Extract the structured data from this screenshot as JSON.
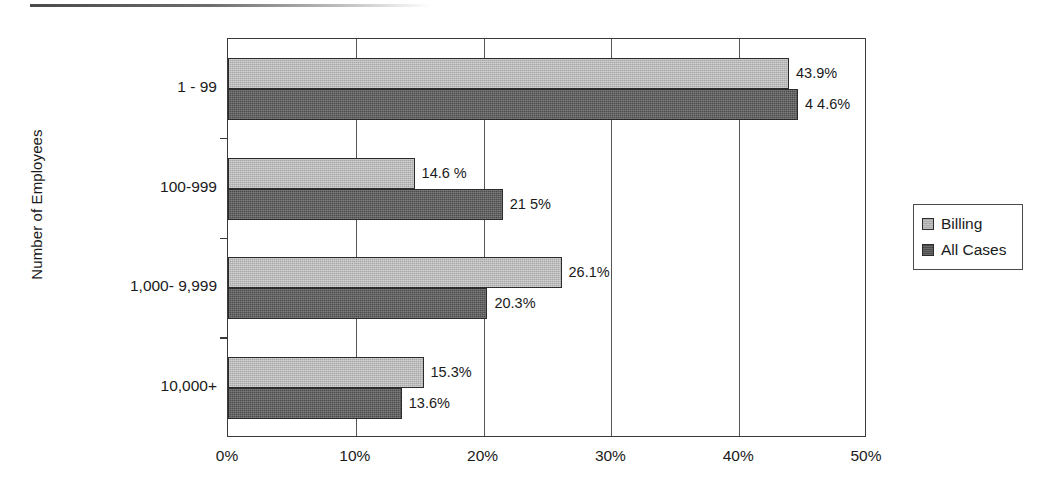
{
  "chart_data": {
    "type": "bar",
    "orientation": "horizontal",
    "title": "",
    "xlabel": "",
    "ylabel": "Number of Employees",
    "categories": [
      "1 - 99",
      "100-999",
      "1,000- 9,999",
      "10,000+"
    ],
    "series": [
      {
        "name": "Billing",
        "color": "#a8a8a8",
        "values": [
          43.9,
          14.6,
          26.1,
          15.3
        ],
        "labels": [
          "43.9%",
          "14.6 %",
          "26.1%",
          "15.3%"
        ]
      },
      {
        "name": "All Cases",
        "color": "#4d4d4d",
        "values": [
          44.6,
          21.5,
          20.3,
          13.6
        ],
        "labels": [
          "4 4.6%",
          "21 5%",
          "20.3%",
          "13.6%"
        ]
      }
    ],
    "xlim": [
      0,
      50
    ],
    "xticks": [
      0,
      10,
      20,
      30,
      40,
      50
    ],
    "xtick_labels": [
      "0%",
      "10%",
      "20%",
      "30%",
      "40%",
      "50%"
    ],
    "grid": true,
    "grid_axis": "x",
    "legend_position": "right"
  },
  "legend": {
    "items": [
      {
        "label": "Billing",
        "swatch": "billing-swatch"
      },
      {
        "label": "All Cases",
        "swatch": "all-cases-swatch"
      }
    ]
  }
}
